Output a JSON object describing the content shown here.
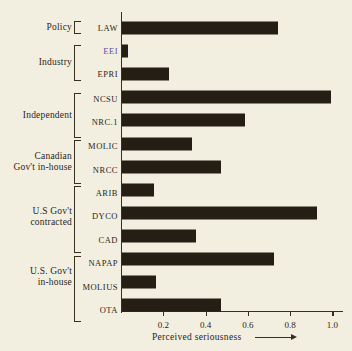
{
  "chart_data": {
    "type": "bar",
    "orientation": "horizontal",
    "title": "",
    "xlabel": "Perceived seriousness",
    "ylabel": "",
    "xlim": [
      0.0,
      1.05
    ],
    "xticks": [
      "0.2",
      "0.4",
      "0.6",
      "0.8",
      "1.0"
    ],
    "xtick_values": [
      0.2,
      0.4,
      0.6,
      0.8,
      1.0
    ],
    "grid": false,
    "legend": false,
    "categories": [
      "LAW",
      "EEI",
      "EPRI",
      "NCSU",
      "NRC.1",
      "MOLIC",
      "NRCC",
      "ARIB",
      "DYCO",
      "CAD",
      "NAPAP",
      "MOLIUS",
      "OTA"
    ],
    "values": [
      0.74,
      0.03,
      0.22,
      0.99,
      0.58,
      0.33,
      0.47,
      0.15,
      0.92,
      0.35,
      0.72,
      0.16,
      0.47
    ],
    "bar_color": "#241e14",
    "background_color": "#f2efe0",
    "groups": [
      {
        "label": "Policy",
        "items": [
          "LAW"
        ]
      },
      {
        "label": "Industry",
        "items": [
          "EEI",
          "EPRI"
        ]
      },
      {
        "label": "Independent",
        "items": [
          "NCSU",
          "NRC.1"
        ]
      },
      {
        "label": "Canadian\nGov't in-house",
        "items": [
          "MOLIC",
          "NRCC"
        ]
      },
      {
        "label": "U.S Gov't\ncontracted",
        "items": [
          "ARIB",
          "DYCO",
          "CAD"
        ]
      },
      {
        "label": "U.S. Gov't\nin-house",
        "items": [
          "NAPAP",
          "MOLIUS",
          "OTA"
        ]
      }
    ]
  },
  "axis": {
    "arrow_icon": "right-arrow-icon"
  },
  "group_labels": [
    "Policy",
    "Industry",
    "Independent",
    "Canadian\nGov't in-house",
    "U.S Gov't\ncontracted",
    "U.S. Gov't\nin-house"
  ],
  "item_labels": [
    "LAW",
    "EEI",
    "EPRI",
    "NCSU",
    "NRC.1",
    "MOLIC",
    "NRCC",
    "ARIB",
    "DYCO",
    "CAD",
    "NAPAP",
    "MOLIUS",
    "OTA"
  ],
  "tick_labels": [
    "0.2",
    "0.4",
    "0.6",
    "0.8",
    "1.0"
  ]
}
